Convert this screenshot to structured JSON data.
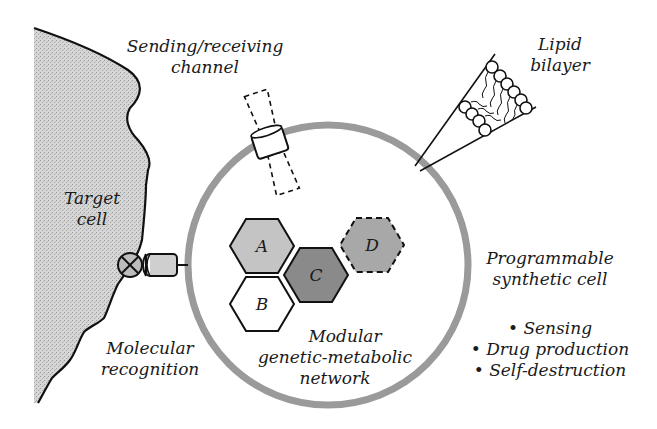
{
  "labels": {
    "channel": [
      "Sending/receiving",
      "channel"
    ],
    "lipid": [
      "Lipid",
      "bilayer"
    ],
    "target": [
      "Target",
      "cell"
    ],
    "recognition": [
      "Molecular",
      "recognition"
    ],
    "network": [
      "Modular",
      "genetic-metabolic",
      "network"
    ],
    "synthetic": [
      "Programmable",
      "synthetic cell"
    ],
    "functions": [
      "• Sensing",
      "• Drug production",
      "• Self-destruction"
    ]
  },
  "modules": [
    {
      "id": "A",
      "label": "A",
      "fill": "#c4c4c4",
      "style": "solid"
    },
    {
      "id": "B",
      "label": "B",
      "fill": "#ffffff",
      "style": "solid"
    },
    {
      "id": "C",
      "label": "C",
      "fill": "#8a8a8a",
      "style": "solid"
    },
    {
      "id": "D",
      "label": "D",
      "fill": "#a8a8a8",
      "style": "dashed"
    }
  ],
  "colors": {
    "membrane": "#9a9a9a",
    "outline": "#111111",
    "target_fill": "#d2d2d2"
  }
}
